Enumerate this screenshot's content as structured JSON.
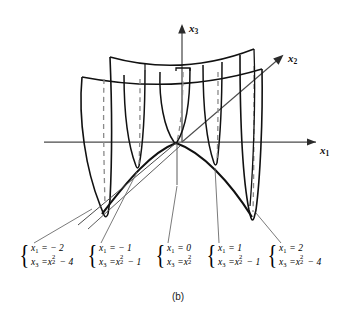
{
  "figure": {
    "caption": "(b)",
    "axes": [
      {
        "name": "x3",
        "label_main": "x",
        "label_sub": "3"
      },
      {
        "name": "x2",
        "label_main": "x",
        "label_sub": "2"
      },
      {
        "name": "x1",
        "label_main": "x",
        "label_sub": "1"
      }
    ],
    "cross_sections": [
      {
        "id": "x1-minus-2",
        "line1": {
          "var": "x",
          "sub": "1",
          "rel": "= − 2"
        },
        "line2": {
          "var": "x",
          "sub": "3",
          "rel": "=",
          "rhs_var": "x",
          "rhs_sub": "2",
          "rhs_sup": "2",
          "tail": "− 4"
        }
      },
      {
        "id": "x1-minus-1",
        "line1": {
          "var": "x",
          "sub": "1",
          "rel": "= − 1"
        },
        "line2": {
          "var": "x",
          "sub": "3",
          "rel": "=",
          "rhs_var": "x",
          "rhs_sub": "2",
          "rhs_sup": "2",
          "tail": "− 1"
        }
      },
      {
        "id": "x1-zero",
        "line1": {
          "var": "x",
          "sub": "1",
          "rel": "= 0"
        },
        "line2": {
          "var": "x",
          "sub": "3",
          "rel": "=",
          "rhs_var": "x",
          "rhs_sub": "2",
          "rhs_sup": "2",
          "tail": ""
        }
      },
      {
        "id": "x1-plus-1",
        "line1": {
          "var": "x",
          "sub": "1",
          "rel": "= 1"
        },
        "line2": {
          "var": "x",
          "sub": "3",
          "rel": "=",
          "rhs_var": "x",
          "rhs_sub": "2",
          "rhs_sup": "2",
          "tail": "− 1"
        }
      },
      {
        "id": "x1-plus-2",
        "line1": {
          "var": "x",
          "sub": "1",
          "rel": "= 2"
        },
        "line2": {
          "var": "x",
          "sub": "3",
          "rel": "=",
          "rhs_var": "x",
          "rhs_sub": "2",
          "rhs_sup": "2",
          "tail": "− 4"
        }
      }
    ],
    "colors": {
      "ink": "#000000",
      "axis": "#4a4a4a",
      "hidden": "#8a8a8a",
      "leader": "#6b6b6b",
      "background": "#ffffff"
    }
  }
}
